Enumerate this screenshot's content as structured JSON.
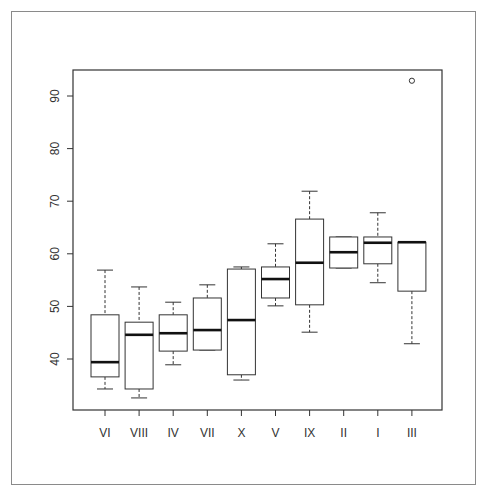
{
  "chart_data": {
    "type": "boxplot",
    "title": "",
    "xlabel": "",
    "ylabel": "",
    "ylim": [
      30,
      95
    ],
    "yticks": [
      40,
      50,
      60,
      70,
      80,
      90
    ],
    "grid": false,
    "legend": null,
    "categories": [
      "VI",
      "VIII",
      "IV",
      "VII",
      "X",
      "V",
      "IX",
      "II",
      "I",
      "III"
    ],
    "boxes": [
      {
        "label": "VI",
        "whisker_low": 34.3,
        "q1": 36.6,
        "median": 39.4,
        "q3": 48.4,
        "whisker_high": 56.9,
        "outliers": []
      },
      {
        "label": "VIII",
        "whisker_low": 32.6,
        "q1": 34.3,
        "median": 44.6,
        "q3": 47.0,
        "whisker_high": 53.7,
        "outliers": []
      },
      {
        "label": "IV",
        "whisker_low": 38.9,
        "q1": 41.5,
        "median": 44.9,
        "q3": 48.4,
        "whisker_high": 50.8,
        "outliers": []
      },
      {
        "label": "VII",
        "whisker_low": 41.7,
        "q1": 41.7,
        "median": 45.5,
        "q3": 51.6,
        "whisker_high": 54.1,
        "outliers": []
      },
      {
        "label": "X",
        "whisker_low": 36.0,
        "q1": 37.0,
        "median": 47.4,
        "q3": 57.1,
        "whisker_high": 57.5,
        "outliers": []
      },
      {
        "label": "V",
        "whisker_low": 50.1,
        "q1": 51.6,
        "median": 55.2,
        "q3": 57.5,
        "whisker_high": 61.9,
        "outliers": []
      },
      {
        "label": "IX",
        "whisker_low": 45.1,
        "q1": 50.3,
        "median": 58.3,
        "q3": 66.6,
        "whisker_high": 71.9,
        "outliers": []
      },
      {
        "label": "II",
        "whisker_low": 57.3,
        "q1": 57.3,
        "median": 60.3,
        "q3": 63.2,
        "whisker_high": 63.2,
        "outliers": []
      },
      {
        "label": "I",
        "whisker_low": 54.5,
        "q1": 58.1,
        "median": 62.1,
        "q3": 63.2,
        "whisker_high": 67.8,
        "outliers": []
      },
      {
        "label": "III",
        "whisker_low": 42.9,
        "q1": 52.9,
        "median": 62.2,
        "q3": 62.2,
        "whisker_high": 62.2,
        "outliers": [
          92.9
        ]
      }
    ]
  },
  "style": {
    "line_color": "#333333",
    "median_color": "#111111",
    "frame_color": "#8a8a8a"
  }
}
